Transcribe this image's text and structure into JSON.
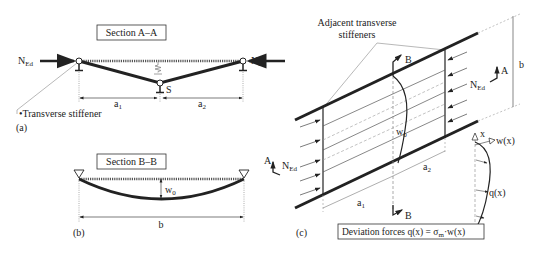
{
  "panel_a": {
    "section_title": "Section A–A",
    "force_label": "N",
    "force_sub": "Ed",
    "support_label": "S",
    "span1": "a",
    "span1_sub": "1",
    "span2": "a",
    "span2_sub": "2",
    "stiffener_note": "•Transverse stiffener",
    "panel_label": "(a)"
  },
  "panel_b": {
    "section_title": "Section B–B",
    "imperfection": "w",
    "imperfection_sub": "0",
    "width_label": "b",
    "panel_label": "(b)"
  },
  "panel_c": {
    "stiffener_callout_line1": "Adjacent transverse",
    "stiffener_callout_line2": "stiffeners",
    "section_b": "B",
    "section_a": "A",
    "force_label": "N",
    "force_sub": "Ed",
    "imperfection": "w",
    "imperfection_sub": "0",
    "width_label": "b",
    "span1": "a",
    "span1_sub": "1",
    "span2": "a",
    "span2_sub": "2",
    "axis_x": "x",
    "deflection": "w(x)",
    "load": "q(x)",
    "deviation_text": "Deviation forces q(x) = σ",
    "deviation_sub": "m",
    "deviation_tail": "·w(x)",
    "panel_label": "(c)"
  },
  "colors": {
    "ink": "#222222",
    "thin": "#555555",
    "guide": "#999999"
  }
}
